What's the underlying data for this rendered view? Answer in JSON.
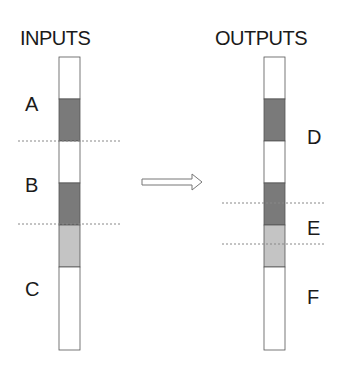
{
  "inputs": {
    "title": "INPUTS",
    "labels": [
      "A",
      "B",
      "C"
    ],
    "segments": [
      "white",
      "dark",
      "white",
      "dark",
      "light",
      "white"
    ]
  },
  "outputs": {
    "title": "OUTPUTS",
    "labels": [
      "D",
      "E",
      "F"
    ],
    "segments": [
      "white",
      "dark",
      "white",
      "dark",
      "light",
      "white"
    ]
  },
  "colors": {
    "dark": "#7a7a7a",
    "light": "#c4c4c4",
    "white": "#ffffff",
    "stroke": "#555555",
    "dotted": "#888888"
  },
  "arrow": {
    "direction": "right"
  }
}
